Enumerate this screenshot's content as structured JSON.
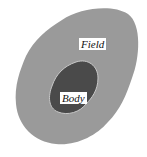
{
  "diagram": {
    "field": {
      "label": "Field",
      "color": "#9a9a9a"
    },
    "body": {
      "label": "Body",
      "color": "#4a4a4a",
      "outline": "#c8c8c8"
    }
  }
}
